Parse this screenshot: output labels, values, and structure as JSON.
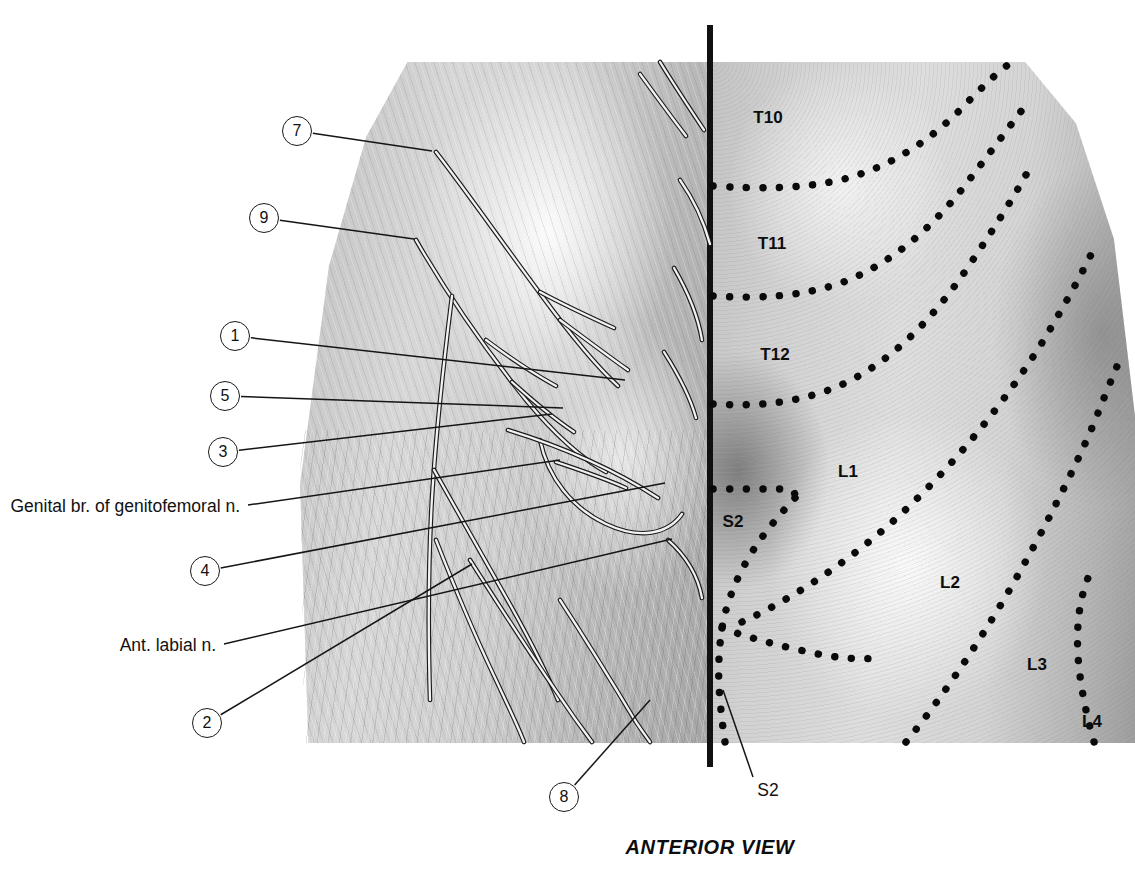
{
  "figure": {
    "caption": "ANTERIOR VIEW",
    "midline_color": "#111111",
    "label_color": "#111111"
  },
  "callouts": [
    {
      "number": "7",
      "cx": 297,
      "cy": 131,
      "leader_to_x": 432,
      "leader_to_y": 151
    },
    {
      "number": "9",
      "cx": 264,
      "cy": 218,
      "leader_to_x": 414,
      "leader_to_y": 239
    },
    {
      "number": "1",
      "cx": 235,
      "cy": 336,
      "leader_to_x": 625,
      "leader_to_y": 380
    },
    {
      "number": "5",
      "cx": 225,
      "cy": 396,
      "leader_to_x": 563,
      "leader_to_y": 408
    },
    {
      "number": "3",
      "cx": 223,
      "cy": 452,
      "leader_to_x": 552,
      "leader_to_y": 414
    },
    {
      "number": "4",
      "cx": 205,
      "cy": 571,
      "leader_to_x": 665,
      "leader_to_y": 483
    },
    {
      "number": "2",
      "cx": 207,
      "cy": 723,
      "leader_to_x": 472,
      "leader_to_y": 564
    },
    {
      "number": "8",
      "cx": 564,
      "cy": 797,
      "leader_to_x": 650,
      "leader_to_y": 700
    }
  ],
  "text_labels": [
    {
      "text": "Genital br. of genitofemoral n.",
      "anchor_x": 240,
      "anchor_y": 507,
      "leader_to_x": 560,
      "leader_to_y": 460
    },
    {
      "text": "Ant. labial n.",
      "anchor_x": 216,
      "anchor_y": 646,
      "leader_to_x": 672,
      "leader_to_y": 539
    }
  ],
  "s2_leader": {
    "label": "S2",
    "label_x": 768,
    "label_y": 790,
    "leader_from_x": 753,
    "leader_from_y": 777,
    "leader_to_x": 723,
    "leader_to_y": 690
  },
  "dermatomes": [
    {
      "label": "T10",
      "x": 768,
      "y": 118
    },
    {
      "label": "T11",
      "x": 772,
      "y": 244
    },
    {
      "label": "T12",
      "x": 775,
      "y": 355
    },
    {
      "label": "L1",
      "x": 848,
      "y": 472
    },
    {
      "label": "S2",
      "x": 733,
      "y": 522
    },
    {
      "label": "L2",
      "x": 950,
      "y": 583
    },
    {
      "label": "L3",
      "x": 1037,
      "y": 665
    },
    {
      "label": "L4",
      "x": 1092,
      "y": 722
    }
  ],
  "dermatome_boundaries": [
    {
      "name": "t10-t11-border",
      "path": "M 713 186 C 760 189 800 189 840 180 C 890 168 930 140 960 110 C 985 84 1000 70 1012 62"
    },
    {
      "name": "t11-t12-border",
      "path": "M 713 296 C 762 299 800 296 838 284 C 890 266 934 226 966 184 C 992 150 1010 126 1022 110"
    },
    {
      "name": "t12-l1-border",
      "path": "M 713 404 C 760 407 798 402 834 388 C 888 366 932 320 966 270 C 996 226 1018 190 1032 164"
    },
    {
      "name": "l1-l2-border",
      "path": "M 742 622 C 790 600 842 566 890 524 C 946 474 998 412 1040 346 C 1068 300 1086 266 1096 244"
    },
    {
      "name": "l2-l3-border",
      "path": "M 906 742 C 940 700 974 650 1006 596 C 1042 534 1072 474 1092 428 C 1104 398 1112 378 1118 364"
    },
    {
      "name": "l3-l4-border",
      "path": "M 1094 742 C 1086 714 1080 684 1078 656 C 1076 624 1080 598 1088 578"
    },
    {
      "name": "s2-upper-border",
      "path": "M 713 489 C 740 489 764 489 782 489 C 792 489 796 492 795 498"
    },
    {
      "name": "s2-lateral-border",
      "path": "M 795 498 C 782 512 766 530 752 552 C 736 578 726 604 722 628 C 718 654 718 678 720 700 C 722 722 724 736 725 742"
    },
    {
      "name": "s2-lower-border",
      "path": "M 722 628 C 744 636 772 644 800 650 C 832 658 858 660 878 658"
    }
  ],
  "nerve_paths": [
    {
      "name": "iliohypogastric-main",
      "path": "M 436 152 C 470 196 506 248 542 296 C 570 334 596 366 618 386"
    },
    {
      "name": "iliohypogastric-branch-a",
      "path": "M 540 292 C 566 306 592 318 614 328"
    },
    {
      "name": "iliohypogastric-branch-b",
      "path": "M 560 320 C 584 338 608 356 628 370"
    },
    {
      "name": "ilioinguinal-main",
      "path": "M 416 240 C 446 292 486 350 526 400 C 556 436 584 460 606 472"
    },
    {
      "name": "ilioinguinal-branch-a",
      "path": "M 486 340 C 510 358 534 374 556 386"
    },
    {
      "name": "ilioinguinal-branch-b",
      "path": "M 512 382 C 534 402 556 420 574 432"
    },
    {
      "name": "lat-femoral-cut",
      "path": "M 452 296 C 444 360 436 430 432 498 C 428 566 428 630 430 700"
    },
    {
      "name": "femoral-branch-1",
      "path": "M 434 470 C 460 516 486 562 512 608 C 532 644 548 676 558 700"
    },
    {
      "name": "femoral-branch-2",
      "path": "M 436 540 C 454 586 474 634 496 680 C 508 706 518 726 524 742"
    },
    {
      "name": "femoral-branch-3",
      "path": "M 470 560 C 498 604 528 650 558 694 C 574 718 586 734 592 742"
    },
    {
      "name": "femoral-branch-4",
      "path": "M 560 600 C 586 640 612 682 636 722 C 644 734 648 739 650 742"
    },
    {
      "name": "genital-branch",
      "path": "M 556 462 C 580 470 604 478 626 488"
    },
    {
      "name": "ant-labial-branch",
      "path": "M 668 540 C 686 556 698 576 702 598"
    },
    {
      "name": "superficial-ring-arc",
      "path": "M 540 440 C 548 478 572 508 606 524 C 640 540 668 534 682 514"
    },
    {
      "name": "inguinal-lig",
      "path": "M 508 430 C 560 446 612 468 658 498"
    },
    {
      "name": "upper-fan-1",
      "path": "M 640 74 C 656 96 672 118 686 136"
    },
    {
      "name": "upper-fan-2",
      "path": "M 660 62 C 676 88 692 112 704 130"
    },
    {
      "name": "lateral-fan-1",
      "path": "M 680 180 C 694 200 704 222 710 244"
    },
    {
      "name": "lateral-fan-2",
      "path": "M 674 268 C 688 292 698 316 702 340"
    },
    {
      "name": "lateral-fan-3",
      "path": "M 664 352 C 678 374 690 396 696 418"
    }
  ]
}
